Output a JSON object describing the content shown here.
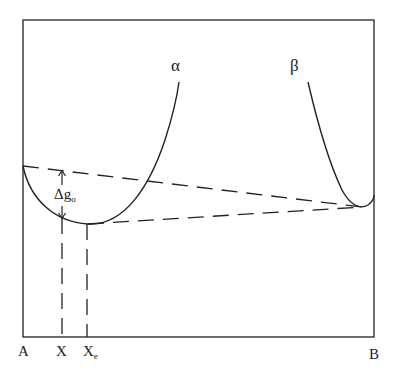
{
  "diagram": {
    "type": "free-energy-composition",
    "curves": [
      {
        "name": "alpha",
        "label": "α"
      },
      {
        "name": "beta",
        "label": "β"
      }
    ],
    "annotation": {
      "main": "Δg",
      "subscript": "o"
    },
    "axis_labels": {
      "left": "A",
      "x": "X",
      "xe_main": "X",
      "xe_sub": "e",
      "right": "B"
    },
    "colors": {
      "line": "#222222",
      "background": "#ffffff"
    }
  }
}
